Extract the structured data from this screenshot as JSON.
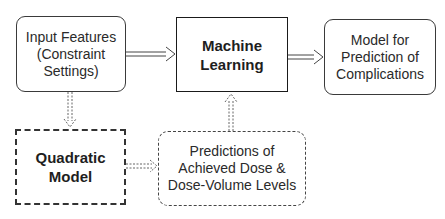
{
  "diagram": {
    "nodes": [
      {
        "id": "input-features",
        "label": "Input Features\n(Constraint\nSettings)",
        "style": "rounded-solid"
      },
      {
        "id": "machine-learning",
        "label": "Machine\nLearning",
        "style": "square-solid-bold"
      },
      {
        "id": "model-prediction",
        "label": "Model for\nPrediction of\nComplications",
        "style": "rounded-solid"
      },
      {
        "id": "quadratic-model",
        "label": "Quadratic\nModel",
        "style": "square-dashed-bold"
      },
      {
        "id": "predictions-dose",
        "label": "Predictions of\nAchieved Dose &\nDose-Volume Levels",
        "style": "rounded-dashed"
      }
    ],
    "edges": [
      {
        "from": "input-features",
        "to": "machine-learning",
        "style": "solid-double"
      },
      {
        "from": "machine-learning",
        "to": "model-prediction",
        "style": "solid-double"
      },
      {
        "from": "input-features",
        "to": "quadratic-model",
        "style": "dashed-double"
      },
      {
        "from": "quadratic-model",
        "to": "predictions-dose",
        "style": "dashed-double"
      },
      {
        "from": "predictions-dose",
        "to": "machine-learning",
        "style": "dashed-double"
      }
    ]
  }
}
